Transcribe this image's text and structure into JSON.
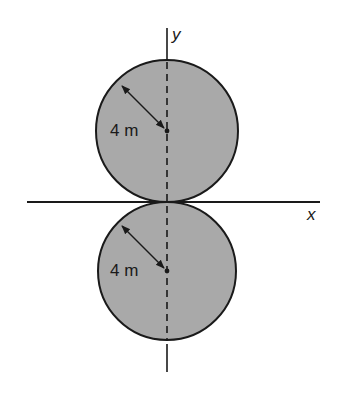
{
  "figure": {
    "axes": {
      "x_label": "x",
      "y_label": "y"
    },
    "circles": [
      {
        "name": "upper-circle",
        "radius_label": "4 m",
        "radius_m": 4,
        "center_m": [
          0,
          4
        ]
      },
      {
        "name": "lower-circle",
        "radius_label": "4 m",
        "radius_m": 4,
        "center_m": [
          0,
          -4
        ]
      }
    ],
    "colors": {
      "fill": "#a9a9a9",
      "stroke": "#1a1a1a",
      "background": "#ffffff"
    }
  }
}
